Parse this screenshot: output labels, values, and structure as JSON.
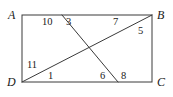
{
  "figure": {
    "kind": "geometry-diagram",
    "width": 173,
    "height": 97,
    "background_color": "#ffffff",
    "stroke_color": "#3a3a3a",
    "text_color": "#1a1a1a",
    "stroke_width": 1,
    "rectangle": {
      "name": "rectangle-abcd",
      "left": 22,
      "top": 15,
      "right": 152,
      "bottom": 82
    },
    "vertices": [
      {
        "id": "A",
        "label": "A",
        "x": 22,
        "y": 15,
        "label_x": 8,
        "label_y": 9
      },
      {
        "id": "B",
        "label": "B",
        "x": 152,
        "y": 15,
        "label_x": 157,
        "label_y": 9
      },
      {
        "id": "C",
        "label": "C",
        "x": 152,
        "y": 82,
        "label_x": 157,
        "label_y": 76
      },
      {
        "id": "D",
        "label": "D",
        "x": 22,
        "y": 82,
        "label_x": 7,
        "label_y": 76
      }
    ],
    "segments": [
      {
        "id": "diagonal-db",
        "name": "diagonal-d-to-b",
        "x1": 22,
        "y1": 82,
        "x2": 152,
        "y2": 15
      },
      {
        "id": "transversal-eg",
        "name": "transversal-ab-to-dc",
        "x1": 62,
        "y1": 15,
        "x2": 118,
        "y2": 82
      }
    ],
    "intersection": {
      "name": "diagonal-crossing-point",
      "x": 88,
      "y": 49
    },
    "angle_labels": [
      {
        "id": "a10",
        "name": "angle-label-10",
        "text": "10",
        "x": 42,
        "y": 17
      },
      {
        "id": "a3",
        "name": "angle-label-3",
        "text": "3",
        "x": 66,
        "y": 17
      },
      {
        "id": "a7",
        "name": "angle-label-7",
        "text": "7",
        "x": 113,
        "y": 17
      },
      {
        "id": "a5",
        "name": "angle-label-5",
        "text": "5",
        "x": 138,
        "y": 26
      },
      {
        "id": "a11",
        "name": "angle-label-11",
        "text": "11",
        "x": 27,
        "y": 60
      },
      {
        "id": "a1",
        "name": "angle-label-1",
        "text": "1",
        "x": 48,
        "y": 71
      },
      {
        "id": "a6",
        "name": "angle-label-6",
        "text": "6",
        "x": 100,
        "y": 71
      },
      {
        "id": "a8",
        "name": "angle-label-8",
        "text": "8",
        "x": 121,
        "y": 71
      }
    ]
  }
}
